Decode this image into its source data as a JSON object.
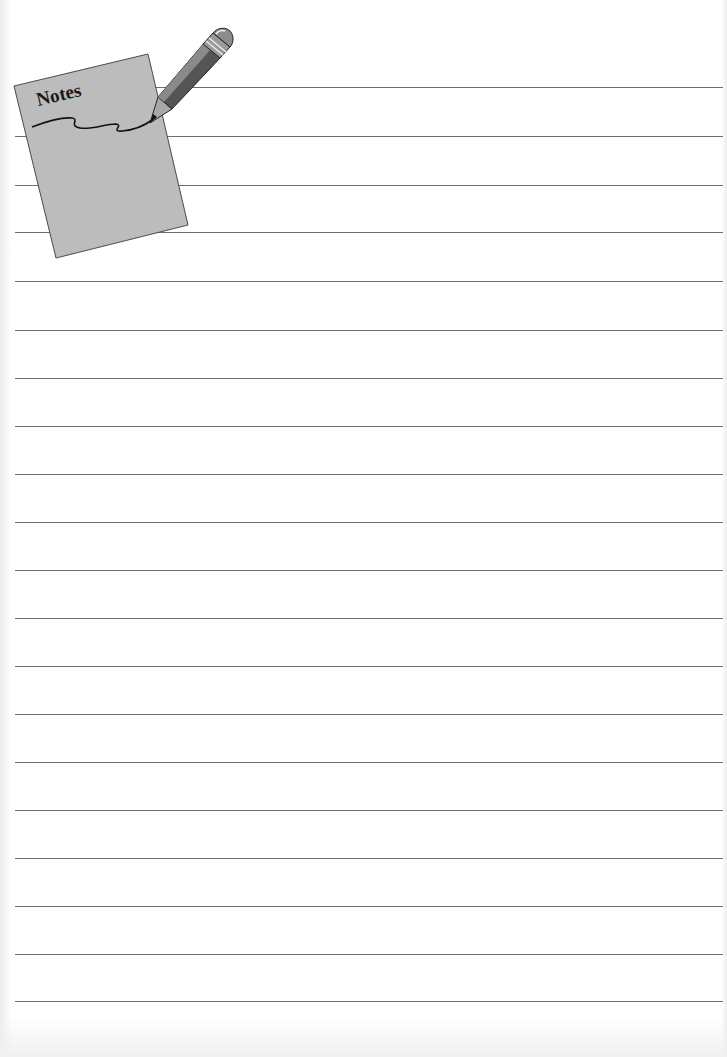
{
  "page": {
    "type": "lined notes page",
    "background_color": "#ffffff",
    "line_color": "#6e6e6e",
    "line_count": 20,
    "line_positions_y": [
      87,
      136,
      185,
      232,
      281,
      330,
      378,
      426,
      474,
      522,
      570,
      618,
      666,
      714,
      762,
      810,
      858,
      906,
      954,
      1001
    ]
  },
  "header_graphic": {
    "icon": "notepad-with-pencil-icon",
    "title": "Notes",
    "pad_color": "#bdbdbd",
    "pencil_body_color": "#555555"
  }
}
